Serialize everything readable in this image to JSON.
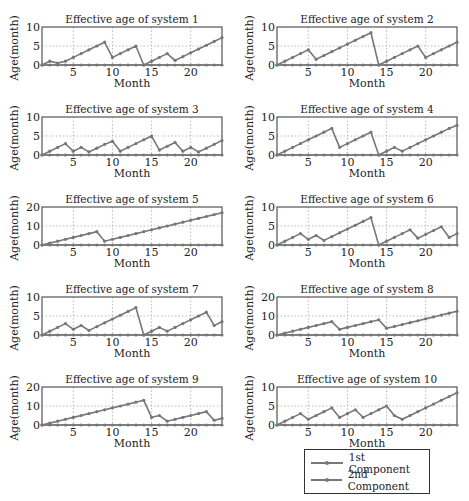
{
  "chart_data": [
    {
      "type": "line",
      "title": "Effective age of system 1",
      "xlabel": "Month",
      "ylabel": "Age(month)",
      "ylim": [
        0,
        10
      ],
      "yticks": [
        0,
        5,
        10
      ],
      "xticks": [
        5,
        10,
        15,
        20
      ],
      "xlim": [
        1,
        24
      ],
      "grid": true,
      "x": [
        1,
        2,
        3,
        4,
        5,
        6,
        7,
        8,
        9,
        10,
        11,
        12,
        13,
        14,
        15,
        16,
        17,
        18,
        19,
        20,
        21,
        22,
        23,
        24
      ],
      "series": [
        {
          "name": "1st Component",
          "values": [
            0,
            0,
            0,
            0,
            0,
            0,
            0,
            0,
            0,
            0,
            0,
            0,
            0,
            0,
            0,
            0,
            0,
            0,
            0,
            0,
            0,
            0,
            0,
            0
          ]
        },
        {
          "name": "2nd Component",
          "values": [
            0,
            1,
            0.5,
            1,
            2,
            3,
            4,
            5,
            6,
            2,
            3,
            4,
            5,
            0,
            1,
            2,
            3,
            1.2,
            2.2,
            3.2,
            4.2,
            5.2,
            6.2,
            7.2
          ]
        }
      ]
    },
    {
      "type": "line",
      "title": "Effective age of system 2",
      "xlabel": "Month",
      "ylabel": "Age(month)",
      "ylim": [
        0,
        10
      ],
      "yticks": [
        0,
        5,
        10
      ],
      "xticks": [
        5,
        10,
        15,
        20
      ],
      "xlim": [
        1,
        24
      ],
      "grid": true,
      "x": [
        1,
        2,
        3,
        4,
        5,
        6,
        7,
        8,
        9,
        10,
        11,
        12,
        13,
        14,
        15,
        16,
        17,
        18,
        19,
        20,
        21,
        22,
        23,
        24
      ],
      "series": [
        {
          "name": "1st Component",
          "values": [
            0,
            0,
            0,
            0,
            0,
            0,
            0,
            0,
            0,
            0,
            0,
            0,
            0,
            0,
            0,
            0,
            0,
            0,
            0,
            0,
            0,
            0,
            0,
            0
          ]
        },
        {
          "name": "2nd Component",
          "values": [
            0,
            1,
            2,
            3,
            4,
            1.5,
            2.5,
            3.5,
            4.5,
            5.5,
            6.5,
            7.5,
            8.5,
            0,
            1,
            2,
            3,
            4,
            5,
            2,
            3,
            4,
            5,
            6
          ]
        }
      ]
    },
    {
      "type": "line",
      "title": "Effective age of system 3",
      "xlabel": "Month",
      "ylabel": "Age(month)",
      "ylim": [
        0,
        10
      ],
      "yticks": [
        0,
        5,
        10
      ],
      "xticks": [
        5,
        10,
        15,
        20
      ],
      "xlim": [
        1,
        24
      ],
      "grid": true,
      "x": [
        1,
        2,
        3,
        4,
        5,
        6,
        7,
        8,
        9,
        10,
        11,
        12,
        13,
        14,
        15,
        16,
        17,
        18,
        19,
        20,
        21,
        22,
        23,
        24
      ],
      "series": [
        {
          "name": "1st Component",
          "values": [
            0,
            0,
            0,
            0,
            0,
            0,
            0,
            0,
            0,
            0,
            0,
            0,
            0,
            0,
            0,
            0,
            0,
            0,
            0,
            0,
            0,
            0,
            0,
            0
          ]
        },
        {
          "name": "2nd Component",
          "values": [
            0,
            1,
            2,
            3,
            1,
            2,
            0.8,
            1.8,
            2.8,
            3.6,
            1,
            2,
            3,
            4,
            5,
            1.3,
            2.3,
            3.3,
            1,
            2,
            0.8,
            1.8,
            2.8,
            3.8
          ]
        }
      ]
    },
    {
      "type": "line",
      "title": "Effective age of system 4",
      "xlabel": "Month",
      "ylabel": "Age(month)",
      "ylim": [
        0,
        10
      ],
      "yticks": [
        0,
        5,
        10
      ],
      "xticks": [
        5,
        10,
        15,
        20
      ],
      "xlim": [
        1,
        24
      ],
      "grid": true,
      "x": [
        1,
        2,
        3,
        4,
        5,
        6,
        7,
        8,
        9,
        10,
        11,
        12,
        13,
        14,
        15,
        16,
        17,
        18,
        19,
        20,
        21,
        22,
        23,
        24
      ],
      "series": [
        {
          "name": "1st Component",
          "values": [
            0,
            0,
            0,
            0,
            0,
            0,
            0,
            0,
            0,
            0,
            0,
            0,
            0,
            0,
            0,
            0,
            0,
            0,
            0,
            0,
            0,
            0,
            0,
            0
          ]
        },
        {
          "name": "2nd Component",
          "values": [
            0,
            1,
            2,
            3,
            4,
            5,
            6,
            7,
            2,
            3,
            4,
            5,
            6,
            0,
            1,
            2,
            1,
            2,
            3,
            4,
            5,
            6,
            7,
            7.8
          ]
        }
      ]
    },
    {
      "type": "line",
      "title": "Effective age of system 5",
      "xlabel": "Month",
      "ylabel": "Age(month)",
      "ylim": [
        0,
        20
      ],
      "yticks": [
        0,
        10,
        20
      ],
      "xticks": [
        5,
        10,
        15,
        20
      ],
      "xlim": [
        1,
        24
      ],
      "grid": true,
      "x": [
        1,
        2,
        3,
        4,
        5,
        6,
        7,
        8,
        9,
        10,
        11,
        12,
        13,
        14,
        15,
        16,
        17,
        18,
        19,
        20,
        21,
        22,
        23,
        24
      ],
      "series": [
        {
          "name": "1st Component",
          "values": [
            0,
            0,
            0,
            0,
            0,
            0,
            0,
            0,
            0,
            0,
            0,
            0,
            0,
            0,
            0,
            0,
            0,
            0,
            0,
            0,
            0,
            0,
            0,
            0
          ]
        },
        {
          "name": "2nd Component",
          "values": [
            0,
            1,
            2,
            3,
            4,
            5,
            6,
            7,
            2,
            3,
            4,
            5,
            6,
            7,
            8,
            9,
            10,
            11,
            12,
            13,
            14,
            15,
            16,
            17
          ]
        }
      ]
    },
    {
      "type": "line",
      "title": "Effective age of system 6",
      "xlabel": "Month",
      "ylabel": "Age(month)",
      "ylim": [
        0,
        10
      ],
      "yticks": [
        0,
        5,
        10
      ],
      "xticks": [
        5,
        10,
        15,
        20
      ],
      "xlim": [
        1,
        24
      ],
      "grid": true,
      "x": [
        1,
        2,
        3,
        4,
        5,
        6,
        7,
        8,
        9,
        10,
        11,
        12,
        13,
        14,
        15,
        16,
        17,
        18,
        19,
        20,
        21,
        22,
        23,
        24
      ],
      "series": [
        {
          "name": "1st Component",
          "values": [
            0,
            0,
            0,
            0,
            0,
            0,
            0,
            0,
            0,
            0,
            0,
            0,
            0,
            0,
            0,
            0,
            0,
            0,
            0,
            0,
            0,
            0,
            0,
            0
          ]
        },
        {
          "name": "2nd Component",
          "values": [
            0,
            1,
            2,
            3,
            1.5,
            2.5,
            1.2,
            2.2,
            3.2,
            4.2,
            5.2,
            6.2,
            7.2,
            0,
            1,
            2,
            3,
            4,
            1.8,
            2.8,
            3.8,
            4.8,
            2,
            3
          ]
        }
      ]
    },
    {
      "type": "line",
      "title": "Effective age of system 7",
      "xlabel": "Month",
      "ylabel": "Age(month)",
      "ylim": [
        0,
        10
      ],
      "yticks": [
        0,
        5,
        10
      ],
      "xticks": [
        5,
        10,
        15,
        20
      ],
      "xlim": [
        1,
        24
      ],
      "grid": true,
      "x": [
        1,
        2,
        3,
        4,
        5,
        6,
        7,
        8,
        9,
        10,
        11,
        12,
        13,
        14,
        15,
        16,
        17,
        18,
        19,
        20,
        21,
        22,
        23,
        24
      ],
      "series": [
        {
          "name": "1st Component",
          "values": [
            0,
            0,
            0,
            0,
            0,
            0,
            0,
            0,
            0,
            0,
            0,
            0,
            0,
            0,
            0,
            0,
            0,
            0,
            0,
            0,
            0,
            0,
            0,
            0
          ]
        },
        {
          "name": "2nd Component",
          "values": [
            0,
            1,
            2,
            3,
            1.5,
            2.5,
            1.2,
            2.2,
            3.2,
            4.2,
            5.2,
            6.2,
            7.2,
            0,
            1,
            2,
            1,
            2,
            3,
            4,
            5,
            6,
            2.5,
            3.5
          ]
        }
      ]
    },
    {
      "type": "line",
      "title": "Effective age of system 8",
      "xlabel": "Month",
      "ylabel": "Age(month)",
      "ylim": [
        0,
        20
      ],
      "yticks": [
        0,
        10,
        20
      ],
      "xticks": [
        5,
        10,
        15,
        20
      ],
      "xlim": [
        1,
        24
      ],
      "grid": true,
      "x": [
        1,
        2,
        3,
        4,
        5,
        6,
        7,
        8,
        9,
        10,
        11,
        12,
        13,
        14,
        15,
        16,
        17,
        18,
        19,
        20,
        21,
        22,
        23,
        24
      ],
      "series": [
        {
          "name": "1st Component",
          "values": [
            0,
            0,
            0,
            0,
            0,
            0,
            0,
            0,
            0,
            0,
            0,
            0,
            0,
            0,
            0,
            0,
            0,
            0,
            0,
            0,
            0,
            0,
            0,
            0
          ]
        },
        {
          "name": "2nd Component",
          "values": [
            0,
            1,
            2,
            3,
            4,
            5,
            6,
            7,
            3,
            4,
            5,
            6,
            7,
            8,
            3.5,
            4.5,
            5.5,
            6.5,
            7.5,
            8.5,
            9.5,
            10.5,
            11.5,
            12.5
          ]
        }
      ]
    },
    {
      "type": "line",
      "title": "Effective age of system 9",
      "xlabel": "Month",
      "ylabel": "Age(month)",
      "ylim": [
        0,
        20
      ],
      "yticks": [
        0,
        10,
        20
      ],
      "xticks": [
        5,
        10,
        15,
        20
      ],
      "xlim": [
        1,
        24
      ],
      "grid": true,
      "x": [
        1,
        2,
        3,
        4,
        5,
        6,
        7,
        8,
        9,
        10,
        11,
        12,
        13,
        14,
        15,
        16,
        17,
        18,
        19,
        20,
        21,
        22,
        23,
        24
      ],
      "series": [
        {
          "name": "1st Component",
          "values": [
            0,
            0,
            0,
            0,
            0,
            0,
            0,
            0,
            0,
            0,
            0,
            0,
            0,
            0,
            0,
            0,
            0,
            0,
            0,
            0,
            0,
            0,
            0,
            0
          ]
        },
        {
          "name": "2nd Component",
          "values": [
            0,
            1,
            2,
            3,
            4,
            5,
            6,
            7,
            8,
            9,
            10,
            11,
            12,
            13,
            4,
            5,
            2,
            3,
            4,
            5,
            6,
            7,
            2.5,
            3.5
          ]
        }
      ]
    },
    {
      "type": "line",
      "title": "Effective age of system 10",
      "xlabel": "Month",
      "ylabel": "Age(month)",
      "ylim": [
        0,
        10
      ],
      "yticks": [
        0,
        5,
        10
      ],
      "xticks": [
        5,
        10,
        15,
        20
      ],
      "xlim": [
        1,
        24
      ],
      "grid": true,
      "x": [
        1,
        2,
        3,
        4,
        5,
        6,
        7,
        8,
        9,
        10,
        11,
        12,
        13,
        14,
        15,
        16,
        17,
        18,
        19,
        20,
        21,
        22,
        23,
        24
      ],
      "series": [
        {
          "name": "1st Component",
          "values": [
            0,
            0,
            0,
            0,
            0,
            0,
            0,
            0,
            0,
            0,
            0,
            0,
            0,
            0,
            0,
            0,
            0,
            0,
            0,
            0,
            0,
            0,
            0,
            0
          ]
        },
        {
          "name": "2nd Component",
          "values": [
            0,
            1,
            2,
            3,
            1.5,
            2.5,
            3.5,
            4.5,
            2,
            3,
            4,
            2,
            3,
            4,
            5,
            2.5,
            1.5,
            2.5,
            3.5,
            4.5,
            5.5,
            6.5,
            7.5,
            8.5
          ]
        }
      ]
    }
  ],
  "legend": {
    "entries": [
      "1st Component",
      "2nd Component"
    ],
    "position": "bottom-right"
  },
  "colors": {
    "line": "#777777",
    "axis": "#555555",
    "grid": "#aaaaaa"
  }
}
